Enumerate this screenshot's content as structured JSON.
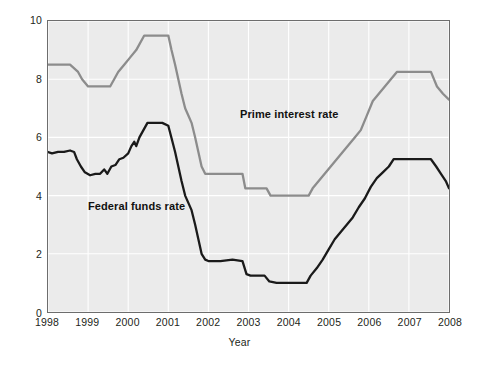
{
  "chart_data": {
    "type": "line",
    "title": "",
    "xlabel": "Year",
    "ylabel": "Percent",
    "xlim": [
      1998,
      2008
    ],
    "ylim": [
      0,
      10
    ],
    "grid": true,
    "legend_position": "inline-annotations",
    "xticks": [
      "1998",
      "1999",
      "2000",
      "2001",
      "2002",
      "2003",
      "2004",
      "2005",
      "2006",
      "2007",
      "2008"
    ],
    "yticks": [
      "0",
      "2",
      "4",
      "6",
      "8",
      "10"
    ],
    "colors": {
      "prime": "#8c8c8c",
      "federal_funds": "#1a1a1a",
      "plot_background": "#ebebeb",
      "gridline": "#ffffff",
      "axis_frame": "#6d6d6d"
    },
    "series": [
      {
        "name": "Prime interest rate",
        "color": "#8c8c8c",
        "annotation": "Prime interest rate",
        "points": [
          [
            1998.0,
            8.5
          ],
          [
            1998.55,
            8.5
          ],
          [
            1998.75,
            8.25
          ],
          [
            1998.85,
            8.0
          ],
          [
            1999.0,
            7.75
          ],
          [
            1999.55,
            7.75
          ],
          [
            1999.65,
            8.0
          ],
          [
            1999.75,
            8.25
          ],
          [
            1999.9,
            8.5
          ],
          [
            2000.05,
            8.75
          ],
          [
            2000.2,
            9.0
          ],
          [
            2000.4,
            9.5
          ],
          [
            2000.55,
            9.5
          ],
          [
            2001.0,
            9.5
          ],
          [
            2001.08,
            9.0
          ],
          [
            2001.17,
            8.5
          ],
          [
            2001.25,
            8.0
          ],
          [
            2001.33,
            7.5
          ],
          [
            2001.42,
            7.0
          ],
          [
            2001.5,
            6.75
          ],
          [
            2001.58,
            6.5
          ],
          [
            2001.67,
            6.0
          ],
          [
            2001.75,
            5.5
          ],
          [
            2001.83,
            5.0
          ],
          [
            2001.92,
            4.75
          ],
          [
            2002.0,
            4.75
          ],
          [
            2002.85,
            4.75
          ],
          [
            2002.92,
            4.25
          ],
          [
            2003.0,
            4.25
          ],
          [
            2003.45,
            4.25
          ],
          [
            2003.55,
            4.0
          ],
          [
            2004.0,
            4.0
          ],
          [
            2004.5,
            4.0
          ],
          [
            2004.6,
            4.25
          ],
          [
            2004.75,
            4.5
          ],
          [
            2004.9,
            4.75
          ],
          [
            2005.05,
            5.0
          ],
          [
            2005.2,
            5.25
          ],
          [
            2005.35,
            5.5
          ],
          [
            2005.5,
            5.75
          ],
          [
            2005.65,
            6.0
          ],
          [
            2005.8,
            6.25
          ],
          [
            2005.95,
            6.75
          ],
          [
            2006.1,
            7.25
          ],
          [
            2006.25,
            7.5
          ],
          [
            2006.4,
            7.75
          ],
          [
            2006.55,
            8.0
          ],
          [
            2006.7,
            8.25
          ],
          [
            2007.0,
            8.25
          ],
          [
            2007.55,
            8.25
          ],
          [
            2007.7,
            7.75
          ],
          [
            2007.85,
            7.5
          ],
          [
            2008.0,
            7.3
          ]
        ]
      },
      {
        "name": "Federal funds rate",
        "color": "#1a1a1a",
        "annotation": "Federal funds rate",
        "points": [
          [
            1998.0,
            5.5
          ],
          [
            1998.1,
            5.45
          ],
          [
            1998.25,
            5.5
          ],
          [
            1998.4,
            5.5
          ],
          [
            1998.55,
            5.55
          ],
          [
            1998.65,
            5.5
          ],
          [
            1998.72,
            5.25
          ],
          [
            1998.82,
            5.0
          ],
          [
            1998.92,
            4.8
          ],
          [
            1999.05,
            4.7
          ],
          [
            1999.18,
            4.75
          ],
          [
            1999.3,
            4.75
          ],
          [
            1999.4,
            4.9
          ],
          [
            1999.48,
            4.75
          ],
          [
            1999.58,
            5.0
          ],
          [
            1999.68,
            5.05
          ],
          [
            1999.78,
            5.25
          ],
          [
            1999.88,
            5.3
          ],
          [
            2000.0,
            5.45
          ],
          [
            2000.08,
            5.7
          ],
          [
            2000.15,
            5.85
          ],
          [
            2000.2,
            5.7
          ],
          [
            2000.28,
            6.0
          ],
          [
            2000.38,
            6.25
          ],
          [
            2000.48,
            6.5
          ],
          [
            2000.6,
            6.5
          ],
          [
            2000.85,
            6.5
          ],
          [
            2001.0,
            6.4
          ],
          [
            2001.08,
            5.98
          ],
          [
            2001.17,
            5.5
          ],
          [
            2001.25,
            5.0
          ],
          [
            2001.33,
            4.5
          ],
          [
            2001.42,
            4.0
          ],
          [
            2001.5,
            3.75
          ],
          [
            2001.58,
            3.5
          ],
          [
            2001.67,
            3.0
          ],
          [
            2001.75,
            2.5
          ],
          [
            2001.83,
            2.0
          ],
          [
            2001.92,
            1.8
          ],
          [
            2002.0,
            1.75
          ],
          [
            2002.3,
            1.75
          ],
          [
            2002.6,
            1.8
          ],
          [
            2002.85,
            1.75
          ],
          [
            2002.95,
            1.3
          ],
          [
            2003.05,
            1.25
          ],
          [
            2003.4,
            1.25
          ],
          [
            2003.52,
            1.05
          ],
          [
            2003.7,
            1.0
          ],
          [
            2004.0,
            1.0
          ],
          [
            2004.45,
            1.0
          ],
          [
            2004.55,
            1.25
          ],
          [
            2004.7,
            1.5
          ],
          [
            2004.85,
            1.8
          ],
          [
            2005.0,
            2.15
          ],
          [
            2005.15,
            2.5
          ],
          [
            2005.3,
            2.75
          ],
          [
            2005.45,
            3.0
          ],
          [
            2005.6,
            3.25
          ],
          [
            2005.75,
            3.6
          ],
          [
            2005.9,
            3.9
          ],
          [
            2006.05,
            4.3
          ],
          [
            2006.2,
            4.6
          ],
          [
            2006.35,
            4.8
          ],
          [
            2006.5,
            5.0
          ],
          [
            2006.62,
            5.25
          ],
          [
            2006.8,
            5.25
          ],
          [
            2007.0,
            5.25
          ],
          [
            2007.55,
            5.25
          ],
          [
            2007.68,
            5.0
          ],
          [
            2007.8,
            4.75
          ],
          [
            2007.92,
            4.5
          ],
          [
            2008.0,
            4.25
          ]
        ]
      }
    ]
  },
  "labels": {
    "y_axis_title": "Percent",
    "x_axis_title": "Year",
    "prime_annotation": "Prime interest rate",
    "ffr_annotation": "Federal funds rate"
  }
}
